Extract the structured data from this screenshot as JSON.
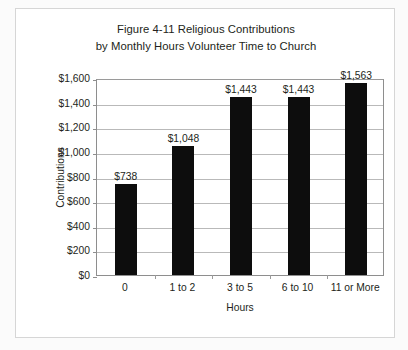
{
  "figure": {
    "title_line1": "Figure 4-11 Religious Contributions",
    "title_line2": "by Monthly Hours Volunteer Time to Church",
    "border_color": "#d6d6d6",
    "background_color": "#ffffff"
  },
  "chart_data": {
    "type": "bar",
    "title": "Figure 4-11 Religious Contributions by Monthly Hours Volunteer Time to Church",
    "categories": [
      "0",
      "1 to 2",
      "3 to 5",
      "6 to 10",
      "11 or More"
    ],
    "values": [
      738,
      1048,
      1443,
      1443,
      1563
    ],
    "value_labels": [
      "$738",
      "$1,048",
      "$1,443",
      "$1,443",
      "$1,563"
    ],
    "xlabel": "Hours",
    "ylabel": "Contributions",
    "ylim": [
      0,
      1600
    ],
    "ytick_step": 200,
    "ytick_labels": [
      "$1,600",
      "$1,400",
      "$1,200",
      "$1,000",
      "$800",
      "$600",
      "$400",
      "$200",
      "$0"
    ],
    "ytick_values": [
      1600,
      1400,
      1200,
      1000,
      800,
      600,
      400,
      200,
      0
    ],
    "grid": true,
    "legend": false,
    "bar_color": "#0d0d0d",
    "gridline_color": "#b9b9b9",
    "axis_color": "#8e8e8e"
  }
}
